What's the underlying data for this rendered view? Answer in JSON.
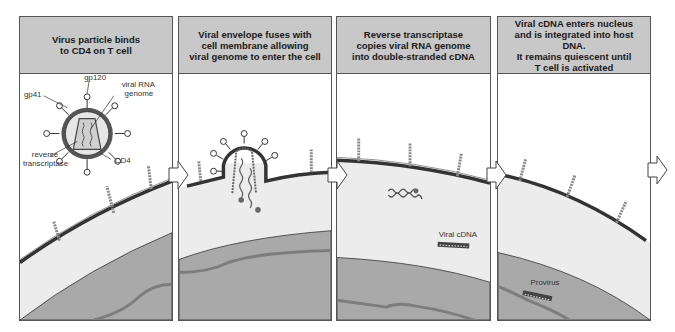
{
  "diagram": {
    "colors": {
      "header_bg": "#c8c8c8",
      "extracellular": "#ffffff",
      "cytoplasm": "#ececec",
      "nucleus": "#a9a9a9",
      "host_dna": "#7d7d7d",
      "membrane": "#333333"
    },
    "panels": [
      {
        "step": 1,
        "caption": "Virus particle binds\nto CD4 on T cell",
        "labels": {
          "gp120": "gp120",
          "gp41": "gp41",
          "viral_rna": "viral RNA",
          "genome": "genome",
          "reverse": "reverse",
          "transcriptase": "transcriptase",
          "cd4": "CD4"
        }
      },
      {
        "step": 2,
        "caption": "Viral envelope fuses with\ncell membrane allowing\nviral genome to enter the cell",
        "labels": {}
      },
      {
        "step": 3,
        "caption": "Reverse transcriptase\ncopies viral RNA genome\ninto double-stranded cDNA",
        "labels": {
          "viral_cdna": "Viral cDNA"
        }
      },
      {
        "step": 4,
        "caption": "Viral cDNA enters nucleus\nand is integrated into host DNA.\nIt remains quiescent until\nT cell is activated",
        "labels": {
          "provirus": "Provirus"
        }
      }
    ],
    "arrows": [
      "arrow-1-2",
      "arrow-2-3",
      "arrow-3-4",
      "arrow-4-next"
    ]
  }
}
